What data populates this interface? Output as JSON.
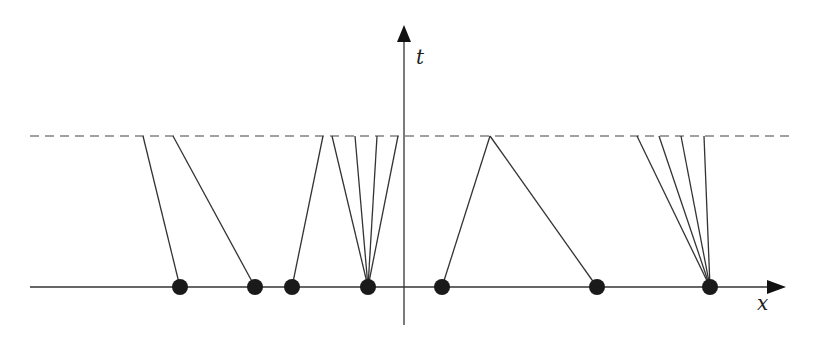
{
  "diagram": {
    "axes": {
      "x_label": "x",
      "t_label": "t"
    },
    "dashed_level_label": "",
    "points": [
      {
        "x": 180,
        "tops": [
          143
        ]
      },
      {
        "x": 255,
        "tops": [
          173
        ]
      },
      {
        "x": 292,
        "tops": [
          323
        ]
      },
      {
        "x": 368,
        "tops": [
          332,
          355,
          377,
          398
        ]
      },
      {
        "x": 442,
        "tops": [
          490
        ]
      },
      {
        "x": 597,
        "tops": [
          490
        ]
      },
      {
        "x": 710,
        "tops": [
          637,
          659,
          681,
          704
        ]
      }
    ],
    "geometry": {
      "x_axis_y": 287,
      "t_axis_x": 404,
      "dashed_y": 136
    }
  }
}
